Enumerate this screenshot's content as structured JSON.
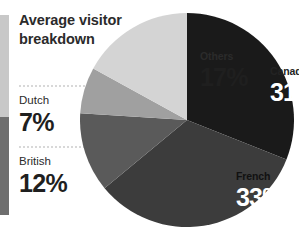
{
  "title": {
    "line1": "Average visitor",
    "line2": "breakdown"
  },
  "legend": {
    "items": [
      {
        "name": "Dutch",
        "value": "7%",
        "swatch": "#c8c8c8"
      },
      {
        "name": "British",
        "value": "12%",
        "swatch": "#6e6e6e"
      }
    ]
  },
  "slices": [
    {
      "name": "Canadian",
      "value": "31%",
      "color": "#1a1a1a"
    },
    {
      "name": "French",
      "value": "33%",
      "color": "#3c3c3c"
    },
    {
      "name": "British",
      "value": "12%",
      "color": "#5a5a5a"
    },
    {
      "name": "Dutch",
      "value": "7%",
      "color": "#a0a0a0"
    },
    {
      "name": "Others",
      "value": "17%",
      "color": "#d4d4d4"
    }
  ],
  "chart_data": {
    "type": "pie",
    "title": "Average visitor breakdown",
    "categories": [
      "Canadian",
      "French",
      "British",
      "Dutch",
      "Others"
    ],
    "values": [
      31,
      33,
      12,
      7,
      17
    ],
    "unit": "%",
    "colors": [
      "#1a1a1a",
      "#3c3c3c",
      "#5a5a5a",
      "#a0a0a0",
      "#d4d4d4"
    ],
    "data_labels": [
      "31%",
      "33%",
      "12%",
      "7%",
      "17%"
    ],
    "start_angle_deg": 0,
    "direction": "clockwise",
    "legend": "left",
    "grid": false,
    "labels_inside": [
      "Canadian",
      "French",
      "Others"
    ],
    "labels_outside": [
      "Dutch",
      "British"
    ]
  }
}
